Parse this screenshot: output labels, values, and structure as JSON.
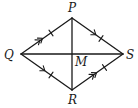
{
  "figure": {
    "type": "quadrilateral",
    "vertices": {
      "P": {
        "label": "P",
        "x": 72,
        "y": 18
      },
      "Q": {
        "label": "Q",
        "x": 21,
        "y": 54
      },
      "R": {
        "label": "R",
        "x": 72,
        "y": 90
      },
      "S": {
        "label": "S",
        "x": 123,
        "y": 54
      }
    },
    "intersection": {
      "label": "M",
      "x": 72,
      "y": 54
    },
    "sides": [
      {
        "name": "QP",
        "arrows": 2,
        "ticks": 1
      },
      {
        "name": "PS",
        "arrows": 1,
        "ticks": 1
      },
      {
        "name": "QR",
        "arrows": 1,
        "ticks": 1
      },
      {
        "name": "RS",
        "arrows": 2,
        "ticks": 1
      }
    ],
    "diagonals": [
      "PR",
      "QS"
    ],
    "colors": {
      "stroke": "#1a1a1a",
      "background": "#ffffff"
    }
  }
}
